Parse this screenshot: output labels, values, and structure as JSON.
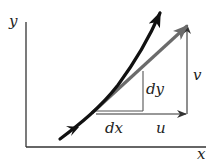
{
  "diagram": {
    "title": "",
    "axes": {
      "x_label": "x",
      "y_label": "y"
    },
    "labels": {
      "dx": "dx",
      "dy": "dy",
      "u": "u",
      "v": "v"
    },
    "elements": [
      {
        "id": "streamline-curve",
        "type": "curve-with-arrows",
        "color": "#111111"
      },
      {
        "id": "velocity-vector",
        "type": "arrow",
        "color": "#6b6b6b"
      },
      {
        "id": "u-component",
        "type": "arrow",
        "label": "u",
        "color": "#333333"
      },
      {
        "id": "v-component",
        "type": "arrow",
        "label": "v",
        "color": "#333333"
      },
      {
        "id": "differential-triangle",
        "type": "right-triangle",
        "labels": [
          "dx",
          "dy"
        ],
        "color": "#555555"
      }
    ],
    "colors": {
      "background": "#ffffff",
      "axis": "#333333",
      "curve": "#111111",
      "vector": "#6b6b6b",
      "thin_lines": "#444444"
    }
  }
}
